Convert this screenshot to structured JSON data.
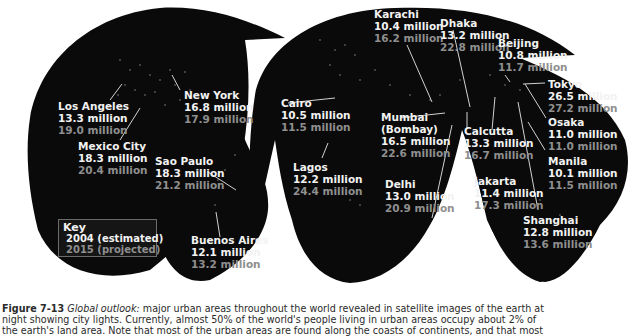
{
  "map": {
    "projection": "interrupted world map at night (satellite city lights)",
    "colors": {
      "land_night": "#0a0a0a",
      "lights": "#e8e8e8",
      "label_2004": "#f2f2f2",
      "label_2015": "#8f8f8f",
      "background": "#ffffff"
    },
    "cities": [
      {
        "id": "los-angeles",
        "name": "Los Angeles",
        "v2004": "13.3 million",
        "v2015": "19.0 million"
      },
      {
        "id": "new-york",
        "name": "New York",
        "v2004": "16.8 million",
        "v2015": "17.9 million"
      },
      {
        "id": "mexico-city",
        "name": "Mexico City",
        "v2004": "18.3 million",
        "v2015": "20.4 million"
      },
      {
        "id": "sao-paulo",
        "name": "Sao Paulo",
        "v2004": "18.3 million",
        "v2015": "21.2 million"
      },
      {
        "id": "buenos-aires",
        "name": "Buenos Aires",
        "v2004": "12.1 million",
        "v2015": "13.2 million"
      },
      {
        "id": "cairo",
        "name": "Cairo",
        "v2004": "10.5 million",
        "v2015": "11.5 million"
      },
      {
        "id": "lagos",
        "name": "Lagos",
        "v2004": "12.2 million",
        "v2015": "24.4 million"
      },
      {
        "id": "karachi",
        "name": "Karachi",
        "v2004": "10.4 million",
        "v2015": "16.2 million"
      },
      {
        "id": "mumbai",
        "name": "Mumbai",
        "name2": "(Bombay)",
        "v2004": "16.5 million",
        "v2015": "22.6 million"
      },
      {
        "id": "delhi",
        "name": "Delhi",
        "v2004": "13.0 million",
        "v2015": "20.9 million"
      },
      {
        "id": "dhaka",
        "name": "Dhaka",
        "v2004": "13.2 million",
        "v2015": "22.8 million"
      },
      {
        "id": "calcutta",
        "name": "Calcutta",
        "v2004": "13.3 million",
        "v2015": "16.7 million"
      },
      {
        "id": "jakarta",
        "name": "Jakarta",
        "v2004": "11.4 million",
        "v2015": "17.3 million"
      },
      {
        "id": "beijing",
        "name": "Beijing",
        "v2004": "10.8 million",
        "v2015": "11.7 million"
      },
      {
        "id": "tokyo",
        "name": "Tokyo",
        "v2004": "26.5 million",
        "v2015": "27.2 million"
      },
      {
        "id": "osaka",
        "name": "Osaka",
        "v2004": "11.0 million",
        "v2015": "11.0 million"
      },
      {
        "id": "manila",
        "name": "Manila",
        "v2004": "10.1 million",
        "v2015": "11.5 million"
      },
      {
        "id": "shanghai",
        "name": "Shanghai",
        "v2004": "12.8 million",
        "v2015": "13.6 million"
      }
    ],
    "key": {
      "title": "Key",
      "items": [
        {
          "label": "2004 (estimated)",
          "color": "#e0e0e0"
        },
        {
          "label": "2015 (projected)",
          "color": "#8f8f8f"
        }
      ]
    }
  },
  "caption": {
    "figure_label": "Figure 7-13",
    "lead": "Global outlook:",
    "line1_rest": " major urban areas throughout the world revealed in satellite images of the earth at",
    "line2": "night showing city lights. Currently, almost 50% of the world's people living in urban areas occupy about 2% of",
    "line3": "the earth's land area. Note that most of the urban areas are found along the coasts of continents, and that most"
  }
}
